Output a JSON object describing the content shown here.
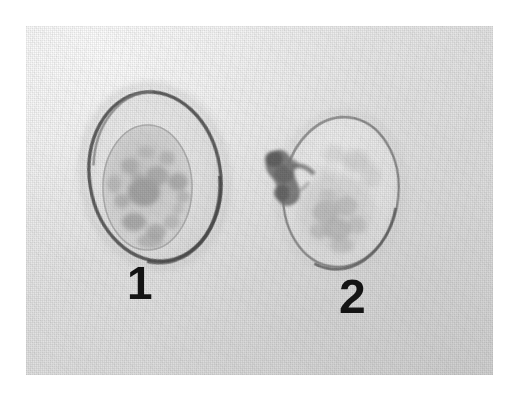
{
  "figure": {
    "kind": "light-micrograph-plate",
    "modality": "brightfield light microscopy",
    "color_mode": "grayscale",
    "page_background_color": "#ffffff",
    "plate": {
      "background_color": "#e2e2e2",
      "highlight_color": "#f2f2f2",
      "shadow_color": "#d2d2d2",
      "texture": "halftone-screen-grain",
      "left": 26,
      "top": 26,
      "width": 467,
      "height": 349
    }
  },
  "labels": [
    {
      "id": "label-1",
      "text": "1",
      "x": 137,
      "y": 282
    },
    {
      "id": "label-2",
      "text": "2",
      "x": 353,
      "y": 295
    }
  ],
  "specimens": [
    {
      "label": "1",
      "name": "oocyst-left",
      "description": "ovoid oocyst with smooth well-defined dark wall enclosing a single rounded granular sporont",
      "wall_tone": "#6a6a6a",
      "wall_thickness_px": 3,
      "outer_bounds": {
        "x": 88,
        "y": 90,
        "width": 134,
        "height": 173
      },
      "inner_body": {
        "name": "sporont",
        "bounds": {
          "x": 103,
          "y": 125,
          "width": 89,
          "height": 125
        },
        "tone": "#cfcfcf",
        "granular": true
      },
      "has_protrusion": false
    },
    {
      "label": "2",
      "name": "oocyst-right",
      "description": "ovoid oocyst with thinner paler wall, diffuse granular contents in lower half, and a small dark irregular body attached at the upper-left pole",
      "wall_tone": "#8b8b8b",
      "wall_thickness_px": 2,
      "outer_bounds": {
        "x": 283,
        "y": 117,
        "width": 117,
        "height": 151
      },
      "inner_body": {
        "name": "granular-mass",
        "bounds": {
          "x": 297,
          "y": 175,
          "width": 80,
          "height": 85
        },
        "tone": "#d6d6d6",
        "granular": true
      },
      "has_protrusion": true,
      "protrusion": {
        "name": "attached-dark-body",
        "bounds": {
          "x": 262,
          "y": 138,
          "width": 30,
          "height": 44
        },
        "tone": "#707070"
      }
    }
  ]
}
